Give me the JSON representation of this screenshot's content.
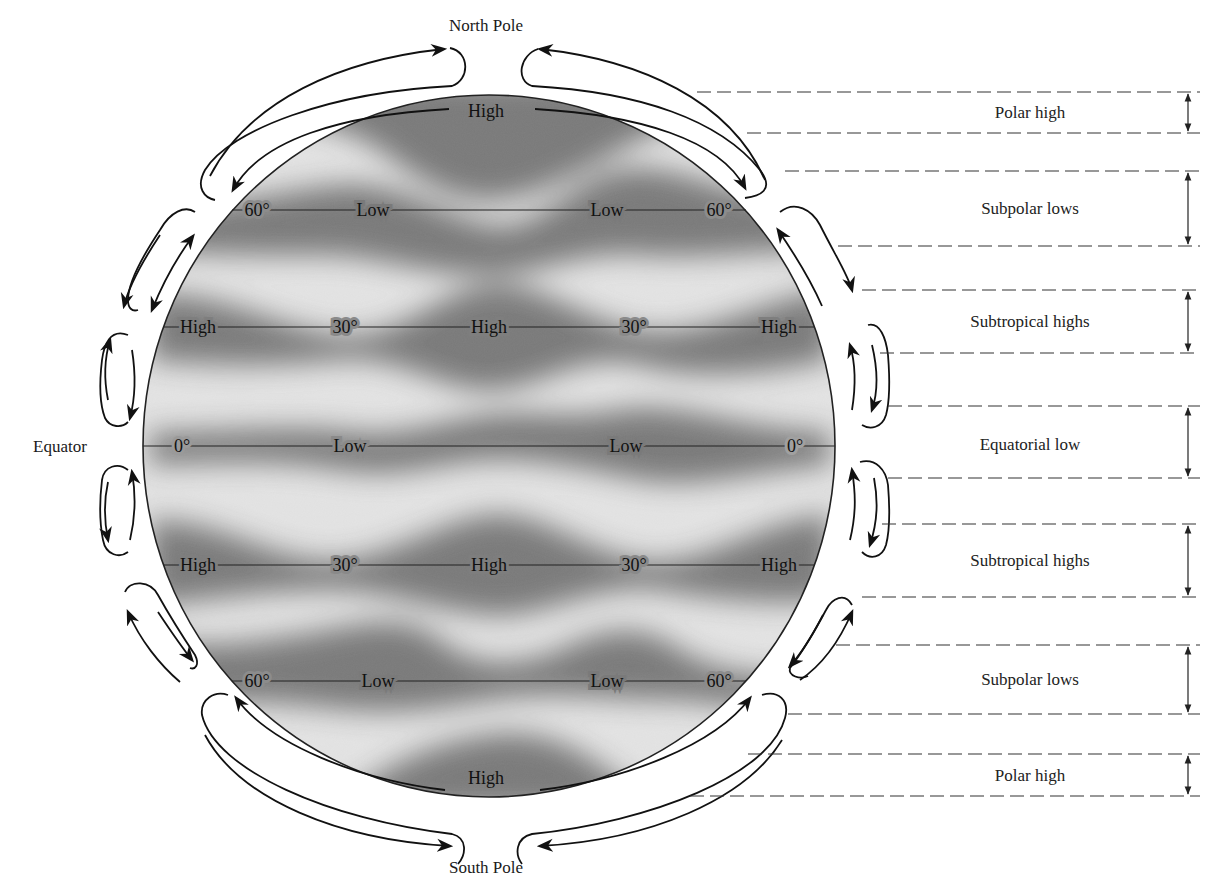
{
  "diagram": {
    "title_top": "North Pole",
    "title_bottom": "South Pole",
    "equator_label": "Equator",
    "colors": {
      "background": "#ffffff",
      "globe_light": "#e6e6e6",
      "globe_dark": "#6e6e6e",
      "ink": "#111111"
    },
    "globe": {
      "pole_labels": {
        "north": "High",
        "south": "High"
      },
      "latitudes": [
        {
          "name": "60N",
          "labels": [
            "60°",
            "Low",
            "Low",
            "60°"
          ]
        },
        {
          "name": "30N",
          "labels": [
            "High",
            "30°",
            "High",
            "30°",
            "High"
          ]
        },
        {
          "name": "0",
          "labels": [
            "0°",
            "Low",
            "Low",
            "0°"
          ]
        },
        {
          "name": "30S",
          "labels": [
            "High",
            "30°",
            "High",
            "30°",
            "High"
          ]
        },
        {
          "name": "60S",
          "labels": [
            "60°",
            "Low",
            "Low",
            "60°"
          ]
        }
      ]
    },
    "zones": [
      {
        "label": "Polar high"
      },
      {
        "label": "Subpolar lows"
      },
      {
        "label": "Subtropical highs"
      },
      {
        "label": "Equatorial low"
      },
      {
        "label": "Subtropical highs"
      },
      {
        "label": "Subpolar lows"
      },
      {
        "label": "Polar high"
      }
    ]
  }
}
